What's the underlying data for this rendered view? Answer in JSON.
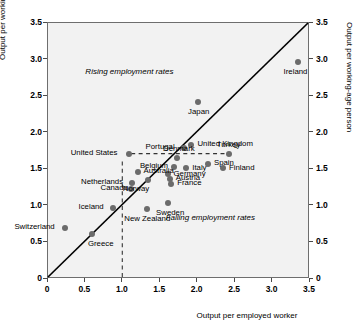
{
  "chart_data": {
    "type": "scatter",
    "title": "",
    "xlabel": "Output per employed worker",
    "ylabel": "Output per working-age person",
    "ylabel_right": "Output per working-age person",
    "xlim": [
      0,
      3.5
    ],
    "ylim": [
      0,
      3.5
    ],
    "xticks": [
      "0",
      "0.5",
      "1.0",
      "1.5",
      "2.0",
      "2.5",
      "3.0",
      "3.5"
    ],
    "xtickvals": [
      0,
      0.5,
      1.0,
      1.5,
      2.0,
      2.5,
      3.0,
      3.5
    ],
    "yticks": [
      "0",
      "0.5",
      "1.0",
      "1.5",
      "2.0",
      "2.5",
      "3.0",
      "3.5"
    ],
    "ytickvals": [
      0,
      0.5,
      1.0,
      1.5,
      2.0,
      2.5,
      3.0,
      3.5
    ],
    "grid": false,
    "legend": "none",
    "marker_color": "#6b6b6b",
    "plot_bg": "#f2f2f2",
    "reference_line": {
      "type": "identity-45-degree",
      "from": [
        0,
        0
      ],
      "to": [
        3.5,
        3.5
      ],
      "style": "solid",
      "color": "#000000"
    },
    "guide_lines": [
      {
        "orientation": "horizontal",
        "value": 1.7,
        "style": "dashed",
        "from_x": 1.12,
        "to_x": 2.42,
        "color": "#333333"
      },
      {
        "orientation": "vertical",
        "value": 1.0,
        "style": "dashed",
        "from_y": 0.0,
        "to_y": 1.62,
        "color": "#333333"
      }
    ],
    "annotations": [
      {
        "text": "Rising employment rates",
        "x": 1.15,
        "y": 2.82
      },
      {
        "text": "Falling employment rates",
        "x": 2.25,
        "y": 0.82
      }
    ],
    "points": [
      {
        "name": "Switzerland",
        "x": 0.24,
        "y": 0.69,
        "label_pos": "left"
      },
      {
        "name": "Greece",
        "x": 0.6,
        "y": 0.6,
        "label_pos": "below-right"
      },
      {
        "name": "Iceland",
        "x": 0.88,
        "y": 0.96,
        "label_pos": "left"
      },
      {
        "name": "Canada",
        "x": 1.12,
        "y": 1.22,
        "label_pos": "left"
      },
      {
        "name": "Netherlands",
        "x": 1.13,
        "y": 1.3,
        "label_pos": "left"
      },
      {
        "name": "Australia",
        "x": 1.21,
        "y": 1.45,
        "label_pos": "right"
      },
      {
        "name": "United States",
        "x": 1.1,
        "y": 1.7,
        "label_pos": "left"
      },
      {
        "name": "Norway",
        "x": 1.35,
        "y": 1.34,
        "label_pos": "below-left"
      },
      {
        "name": "New Zealand",
        "x": 1.33,
        "y": 0.94,
        "label_pos": "below"
      },
      {
        "name": "Sweden",
        "x": 1.62,
        "y": 1.02,
        "label_pos": "below"
      },
      {
        "name": "France",
        "x": 1.66,
        "y": 1.29,
        "label_pos": "right"
      },
      {
        "name": "Austria",
        "x": 1.64,
        "y": 1.36,
        "label_pos": "right"
      },
      {
        "name": "Germany",
        "x": 1.61,
        "y": 1.42,
        "label_pos": "right"
      },
      {
        "name": "Belgium",
        "x": 1.7,
        "y": 1.52,
        "label_pos": "left"
      },
      {
        "name": "Denmark",
        "x": 1.74,
        "y": 1.64,
        "label_pos": "above"
      },
      {
        "name": "Italy",
        "x": 1.86,
        "y": 1.5,
        "label_pos": "right"
      },
      {
        "name": "Portugal",
        "x": 1.83,
        "y": 1.78,
        "label_pos": "left"
      },
      {
        "name": "United Kingdom",
        "x": 1.93,
        "y": 1.82,
        "label_pos": "right"
      },
      {
        "name": "Spain",
        "x": 2.15,
        "y": 1.56,
        "label_pos": "right"
      },
      {
        "name": "Japan",
        "x": 2.02,
        "y": 2.4,
        "label_pos": "below"
      },
      {
        "name": "Finland",
        "x": 2.35,
        "y": 1.5,
        "label_pos": "right"
      },
      {
        "name": "Turkey",
        "x": 2.43,
        "y": 1.7,
        "label_pos": "above"
      },
      {
        "name": "Ireland",
        "x": 3.35,
        "y": 2.95,
        "label_pos": "below"
      }
    ]
  }
}
